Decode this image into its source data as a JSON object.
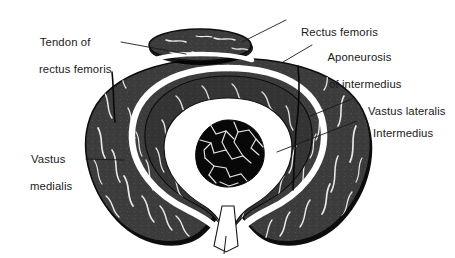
{
  "figure": {
    "background_color": "#ffffff",
    "muscle_color": "#3c3c3c",
    "muscle_color_dark": "#2a2a2a",
    "fascia_color": "#ffffff",
    "bone_color": "#080808",
    "outline_color": "#111111",
    "leader_color": "#1a1a1a",
    "text_color": "#1a1a1a"
  },
  "labels": {
    "tendon_of_rectus_femoris": {
      "line1": "Tendon of",
      "line2": "rectus femoris"
    },
    "rectus_femoris": {
      "line1": "Rectus femoris"
    },
    "aponeurosis_of_intermedius": {
      "line1": "Aponeurosis",
      "line2": "of intermedius"
    },
    "vastus_lateralis": {
      "line1": "Vastus lateralis"
    },
    "intermedius": {
      "line1": "Intermedius"
    },
    "vastus_medialis": {
      "line1": "Vastus",
      "line2": "medialis"
    }
  },
  "structures": [
    {
      "name": "rectus-femoris",
      "kind": "muscle"
    },
    {
      "name": "vastus-lateralis",
      "kind": "muscle"
    },
    {
      "name": "vastus-medialis",
      "kind": "muscle"
    },
    {
      "name": "vastus-intermedius",
      "kind": "muscle"
    },
    {
      "name": "aponeurosis-of-intermedius",
      "kind": "fascia"
    },
    {
      "name": "tendon-of-rectus-femoris",
      "kind": "tendon"
    },
    {
      "name": "femur",
      "kind": "bone"
    }
  ]
}
